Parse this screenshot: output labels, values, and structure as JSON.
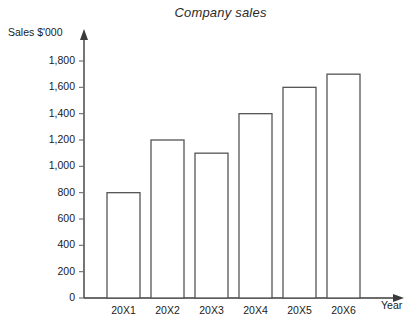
{
  "chart_data": {
    "type": "bar",
    "title": "Company sales",
    "xlabel": "Year",
    "ylabel": "Sales $'000",
    "categories": [
      "20X1",
      "20X2",
      "20X3",
      "20X4",
      "20X5",
      "20X6"
    ],
    "values": [
      800,
      1200,
      1100,
      1400,
      1600,
      1700
    ],
    "ylim": [
      0,
      1800
    ],
    "ytick_step": 200,
    "ytick_labels": [
      "0",
      "200",
      "400",
      "600",
      "800",
      "1,000",
      "1,200",
      "1,400",
      "1,600",
      "1,800"
    ],
    "ytick_values": [
      0,
      200,
      400,
      600,
      800,
      1000,
      1200,
      1400,
      1600,
      1800
    ],
    "grid": false,
    "legend": false,
    "bar_fill_color": "#ffffff",
    "bar_stroke_color": "#555555",
    "axis_color": "#3b3b3b",
    "background_color": "#ffffff",
    "axis_arrows": true
  }
}
